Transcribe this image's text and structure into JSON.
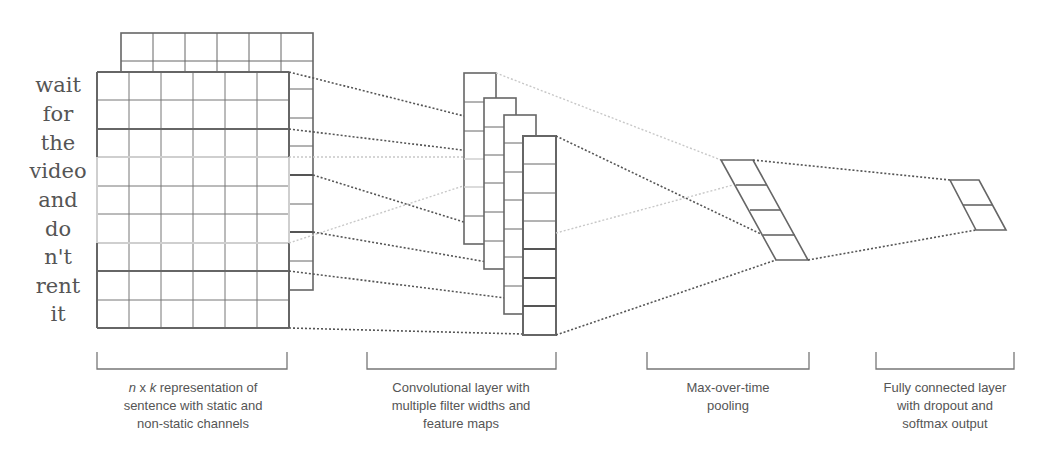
{
  "figure": {
    "sentence_words": [
      "wait",
      "for",
      "the",
      "video",
      "and",
      "do",
      "n't",
      "rent",
      "it"
    ],
    "captions": {
      "input": {
        "line1_italic_n": "n",
        "line1_x": " x ",
        "line1_italic_k": "k",
        "line1_rest": " representation of",
        "line2": "sentence with static and",
        "line3": "non-static channels"
      },
      "conv": {
        "line1": "Convolutional layer with",
        "line2": "multiple filter widths and",
        "line3": "feature maps"
      },
      "pool": {
        "line1": "Max-over-time",
        "line2": "pooling"
      },
      "fc": {
        "line1": "Fully connected layer",
        "line2": "with dropout and",
        "line3": "softmax output"
      }
    },
    "stages": [
      {
        "name": "input-matrix",
        "rows": 9,
        "cols": 6,
        "channels": 2
      },
      {
        "name": "conv-feature-maps",
        "maps": 4
      },
      {
        "name": "max-pool-vector",
        "cells": 4
      },
      {
        "name": "fc-softmax-output",
        "cells": 2
      }
    ],
    "colors": {
      "line_dark": "#555555",
      "line_light": "#c8c8c8",
      "text": "#555555"
    }
  }
}
